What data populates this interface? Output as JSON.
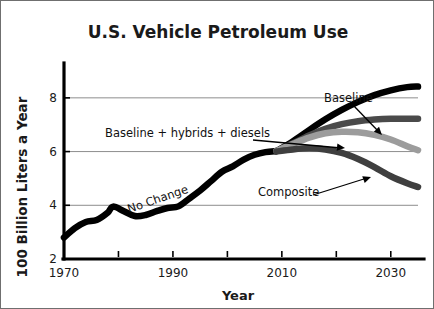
{
  "chart_data": {
    "type": "line",
    "title": "U.S. Vehicle Petroleum Use",
    "xlabel": "Year",
    "ylabel": "100 Billion Liters a Year",
    "xlim": [
      1970,
      2035
    ],
    "ylim": [
      2,
      9
    ],
    "grid": true,
    "grid_axis": "y",
    "legend": "inline-annotations",
    "xticks": [
      1970,
      1980,
      1990,
      2000,
      2010,
      2020,
      2030
    ],
    "xticklabels": [
      "1970",
      "",
      "1990",
      "",
      "2010",
      "",
      "2030"
    ],
    "yticks": [
      2,
      4,
      6,
      8
    ],
    "yticklabels": [
      "2",
      "4",
      "6",
      "8"
    ],
    "series": [
      {
        "name": "No Change",
        "color": "#000000",
        "width": 6.5,
        "annotation": "No Change",
        "points": [
          [
            1970,
            2.8
          ],
          [
            1972,
            3.15
          ],
          [
            1974,
            3.38
          ],
          [
            1976,
            3.45
          ],
          [
            1978,
            3.72
          ],
          [
            1979,
            3.95
          ],
          [
            1981,
            3.78
          ],
          [
            1983,
            3.6
          ],
          [
            1985,
            3.64
          ],
          [
            1987,
            3.78
          ],
          [
            1989,
            3.9
          ],
          [
            1991,
            3.96
          ],
          [
            1993,
            4.25
          ],
          [
            1995,
            4.55
          ],
          [
            1997,
            4.9
          ],
          [
            1999,
            5.25
          ],
          [
            2001,
            5.45
          ],
          [
            2003,
            5.7
          ],
          [
            2005,
            5.88
          ],
          [
            2007,
            5.98
          ],
          [
            2009,
            6.02
          ]
        ]
      },
      {
        "name": "Baseline",
        "color": "#000000",
        "width": 6.5,
        "annotation": "Baseline",
        "points": [
          [
            2009,
            6.02
          ],
          [
            2012,
            6.38
          ],
          [
            2015,
            6.8
          ],
          [
            2018,
            7.2
          ],
          [
            2021,
            7.55
          ],
          [
            2024,
            7.85
          ],
          [
            2027,
            8.1
          ],
          [
            2030,
            8.28
          ],
          [
            2033,
            8.4
          ],
          [
            2035,
            8.42
          ]
        ]
      },
      {
        "name": "Baseline + hybrids + diesels",
        "color": "#4a4a4a",
        "width": 6.5,
        "annotation": "Baseline + hybrids + diesels",
        "points": [
          [
            2009,
            6.02
          ],
          [
            2012,
            6.3
          ],
          [
            2015,
            6.6
          ],
          [
            2018,
            6.85
          ],
          [
            2021,
            7.02
          ],
          [
            2024,
            7.13
          ],
          [
            2027,
            7.19
          ],
          [
            2030,
            7.22
          ],
          [
            2033,
            7.22
          ],
          [
            2035,
            7.22
          ]
        ]
      },
      {
        "name": "Hybrids and diesels light",
        "color": "#9c9c9c",
        "width": 6.5,
        "annotation": "",
        "points": [
          [
            2009,
            6.02
          ],
          [
            2012,
            6.28
          ],
          [
            2015,
            6.52
          ],
          [
            2018,
            6.68
          ],
          [
            2021,
            6.74
          ],
          [
            2024,
            6.72
          ],
          [
            2027,
            6.62
          ],
          [
            2030,
            6.45
          ],
          [
            2033,
            6.2
          ],
          [
            2035,
            6.05
          ]
        ]
      },
      {
        "name": "Composite",
        "color": "#3f3f3f",
        "width": 6.5,
        "annotation": "Composite",
        "points": [
          [
            2009,
            6.0
          ],
          [
            2012,
            6.08
          ],
          [
            2015,
            6.12
          ],
          [
            2018,
            6.08
          ],
          [
            2021,
            5.95
          ],
          [
            2024,
            5.72
          ],
          [
            2027,
            5.42
          ],
          [
            2030,
            5.08
          ],
          [
            2033,
            4.82
          ],
          [
            2035,
            4.68
          ]
        ]
      }
    ],
    "annotations": [
      {
        "text": "Baseline",
        "x": 323,
        "y": 101,
        "rotate": 0
      },
      {
        "text": "Baseline + hybrids + diesels",
        "x": 104,
        "y": 136,
        "rotate": 0
      },
      {
        "text": "No Change",
        "x": 128,
        "y": 212,
        "rotate": -19
      },
      {
        "text": "Composite",
        "x": 257,
        "y": 195,
        "rotate": 0
      }
    ]
  }
}
